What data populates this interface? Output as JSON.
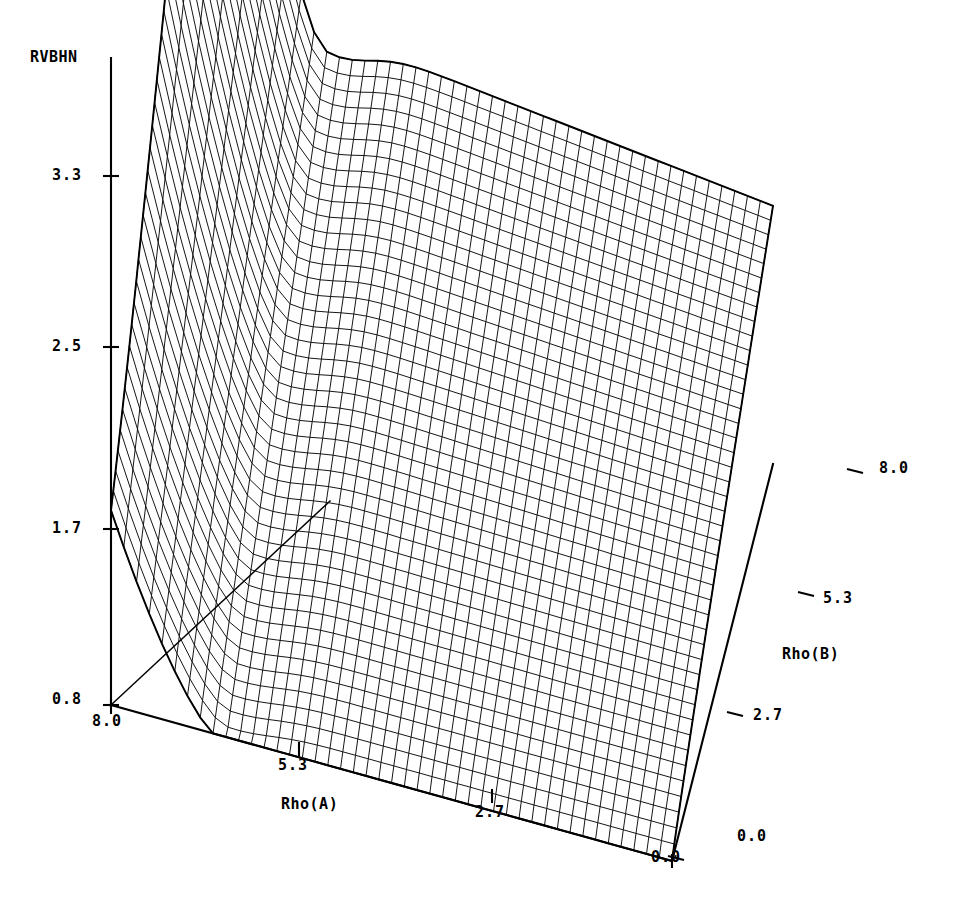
{
  "page": {
    "header_fragment": "",
    "page_number": ""
  },
  "chart_data": {
    "type": "surface3d",
    "title": "",
    "zlabel": "RVBHN",
    "xlabel": "Rho(A)",
    "ylabel": "Rho(B)",
    "z_ticks": [
      "3.3",
      "2.5",
      "1.7",
      "0.8"
    ],
    "z_tick_values": [
      3.3,
      2.5,
      1.7,
      0.8
    ],
    "zlim": [
      0.8,
      3.3
    ],
    "x_ticks": [
      "8.0",
      "5.3",
      "2.7",
      "0.0"
    ],
    "x_tick_values": [
      8.0,
      5.3,
      2.7,
      0.0
    ],
    "xlim": [
      0.0,
      8.0
    ],
    "y_ticks": [
      "0.0",
      "2.7",
      "5.3",
      "8.0"
    ],
    "y_tick_values": [
      0.0,
      2.7,
      5.3,
      8.0
    ],
    "ylim": [
      0.0,
      8.0
    ],
    "grid": true,
    "legend": null,
    "mesh_n_x": 44,
    "mesh_n_y": 44,
    "corner_values": [
      {
        "x": 8.0,
        "y": 8.0,
        "z": 3.3
      },
      {
        "x": 0.0,
        "y": 8.0,
        "z": 2.55
      },
      {
        "x": 8.0,
        "y": 0.0,
        "z": 2.0
      },
      {
        "x": 0.0,
        "y": 0.0,
        "z": 0.8
      }
    ]
  },
  "axes": {
    "z": {
      "label": "RVBHN",
      "ticks": [
        {
          "text": "3.3",
          "left": 52,
          "top": 166
        },
        {
          "text": "2.5",
          "left": 52,
          "top": 337
        },
        {
          "text": "1.7",
          "left": 52,
          "top": 519
        },
        {
          "text": "0.8",
          "left": 52,
          "top": 690
        }
      ]
    },
    "x": {
      "label": "Rho(A)",
      "ticks": [
        {
          "text": "8.0",
          "left": 92,
          "top": 712
        },
        {
          "text": "5.3",
          "left": 278,
          "top": 756
        },
        {
          "text": "2.7",
          "left": 475,
          "top": 803
        },
        {
          "text": "0.0",
          "left": 651,
          "top": 848
        }
      ]
    },
    "y": {
      "label": "Rho(B)",
      "ticks": [
        {
          "text": "0.0",
          "left": 737,
          "top": 827
        },
        {
          "text": "2.7",
          "left": 753,
          "top": 706
        },
        {
          "text": "5.3",
          "left": 823,
          "top": 589
        },
        {
          "text": "8.0",
          "left": 879,
          "top": 459
        }
      ]
    }
  }
}
